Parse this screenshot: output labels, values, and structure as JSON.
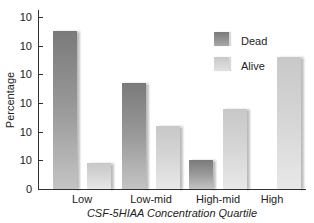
{
  "chart_data": {
    "type": "bar",
    "title": "",
    "xlabel": "CSF-5HIAA Concentration Quartile",
    "ylabel": "Percentage",
    "categories": [
      "Low",
      "Low-mid",
      "High-mid",
      "High"
    ],
    "series": [
      {
        "name": "Dead",
        "color": "#8a8a8a",
        "values": [
          55,
          37,
          10,
          0
        ]
      },
      {
        "name": "Alive",
        "color": "#d4d4d4",
        "values": [
          9,
          22,
          28,
          46
        ]
      }
    ],
    "ylim": [
      0,
      60
    ],
    "yticks": [
      0,
      10,
      20,
      30,
      40,
      50,
      60
    ],
    "ytick_labels_displayed": [
      "0",
      "10",
      "10",
      "10",
      "10",
      "10",
      "10"
    ],
    "grid": false,
    "legend_position": "upper right"
  },
  "legend": {
    "dead": "Dead",
    "alive": "Alive"
  }
}
